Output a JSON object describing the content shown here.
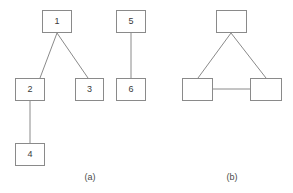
{
  "figure": {
    "background_color": "#ffffff",
    "stroke_color": "#8a8a8a",
    "text_color": "#3a3a3a",
    "width": 293,
    "height": 193
  },
  "panels": [
    {
      "id": "panel-a",
      "caption": "(a)",
      "caption_x": 90,
      "caption_y": 172,
      "nodes": [
        {
          "label": "1",
          "x": 42,
          "y": 10,
          "w": 30,
          "h": 23
        },
        {
          "label": "2",
          "x": 15,
          "y": 78,
          "w": 30,
          "h": 23
        },
        {
          "label": "3",
          "x": 75,
          "y": 78,
          "w": 29,
          "h": 23
        },
        {
          "label": "4",
          "x": 15,
          "y": 143,
          "w": 30,
          "h": 23
        },
        {
          "label": "5",
          "x": 116,
          "y": 10,
          "w": 30,
          "h": 23
        },
        {
          "label": "6",
          "x": 116,
          "y": 78,
          "w": 30,
          "h": 23
        }
      ],
      "edges": [
        {
          "from": "1",
          "to": "2",
          "x1": 57,
          "y1": 33,
          "x2": 40,
          "y2": 78
        },
        {
          "from": "1",
          "to": "3",
          "x1": 57,
          "y1": 33,
          "x2": 88,
          "y2": 78
        },
        {
          "from": "2",
          "to": "4",
          "x1": 30,
          "y1": 101,
          "x2": 30,
          "y2": 143
        },
        {
          "from": "5",
          "to": "6",
          "x1": 131,
          "y1": 33,
          "x2": 131,
          "y2": 78
        }
      ]
    },
    {
      "id": "panel-b",
      "caption": "(b)",
      "caption_x": 232,
      "caption_y": 172,
      "nodes": [
        {
          "label": "",
          "x": 216,
          "y": 10,
          "w": 31,
          "h": 23
        },
        {
          "label": "",
          "x": 182,
          "y": 78,
          "w": 31,
          "h": 23
        },
        {
          "label": "",
          "x": 250,
          "y": 78,
          "w": 32,
          "h": 23
        }
      ],
      "edges": [
        {
          "from": "top",
          "to": "bottom-left",
          "x1": 231,
          "y1": 33,
          "x2": 198,
          "y2": 78
        },
        {
          "from": "top",
          "to": "bottom-right",
          "x1": 231,
          "y1": 33,
          "x2": 266,
          "y2": 78
        },
        {
          "from": "bottom-left",
          "to": "bottom-right",
          "x1": 213,
          "y1": 89,
          "x2": 250,
          "y2": 89
        }
      ]
    }
  ]
}
